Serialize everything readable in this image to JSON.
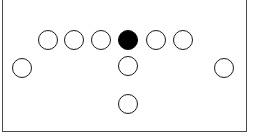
{
  "diagram": {
    "type": "sports-formation",
    "field": {
      "background_color": "#ffffff",
      "border_color": "#4a4a4a",
      "border_width": 1,
      "x": 2,
      "y": -4,
      "width": 245,
      "height": 136
    },
    "marker_style": {
      "shape": "circle",
      "radius": 10,
      "outline_color": "#1a1a1a",
      "outline_width": 1.4,
      "open_fill_color": "#ffffff",
      "highlight_fill_color": "#000000"
    },
    "rows": [
      {
        "name": "front-line",
        "y": 40,
        "markers": [
          {
            "name": "front-line-player-1",
            "label": "",
            "x": 48,
            "y": 40,
            "r": 10,
            "filled": false
          },
          {
            "name": "front-line-player-2",
            "label": "",
            "x": 74,
            "y": 40,
            "r": 10,
            "filled": false
          },
          {
            "name": "front-line-player-3",
            "label": "",
            "x": 101,
            "y": 40,
            "r": 10,
            "filled": false
          },
          {
            "name": "front-line-player-center",
            "label": "",
            "x": 128,
            "y": 40,
            "r": 10,
            "filled": true
          },
          {
            "name": "front-line-player-5",
            "label": "",
            "x": 156,
            "y": 40,
            "r": 10,
            "filled": false
          },
          {
            "name": "front-line-player-6",
            "label": "",
            "x": 183,
            "y": 40,
            "r": 10,
            "filled": false
          }
        ]
      },
      {
        "name": "second-line",
        "y": 68,
        "markers": [
          {
            "name": "second-line-player-left-wide",
            "label": "",
            "x": 22,
            "y": 68,
            "r": 10,
            "filled": false
          },
          {
            "name": "second-line-player-center",
            "label": "",
            "x": 128,
            "y": 66,
            "r": 10,
            "filled": false
          },
          {
            "name": "second-line-player-right-wide",
            "label": "",
            "x": 224,
            "y": 68,
            "r": 10,
            "filled": false
          }
        ]
      },
      {
        "name": "back-line",
        "y": 104,
        "markers": [
          {
            "name": "back-line-player-center",
            "label": "",
            "x": 128,
            "y": 104,
            "r": 10,
            "filled": false
          }
        ]
      }
    ]
  }
}
